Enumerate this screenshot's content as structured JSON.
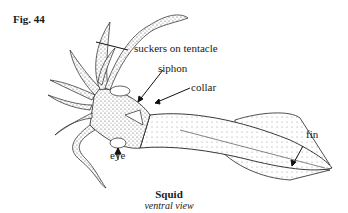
{
  "figure": {
    "number_label": "Fig. 44",
    "title": "Squid",
    "subtitle": "ventral view"
  },
  "labels": {
    "suckers": "suckers on tentacle",
    "siphon": "siphon",
    "collar": "collar",
    "fin": "fin",
    "eye": "eye"
  },
  "colors": {
    "ink": "#1a1a1a",
    "stipple": "#b8b8b8",
    "background": "#ffffff"
  }
}
